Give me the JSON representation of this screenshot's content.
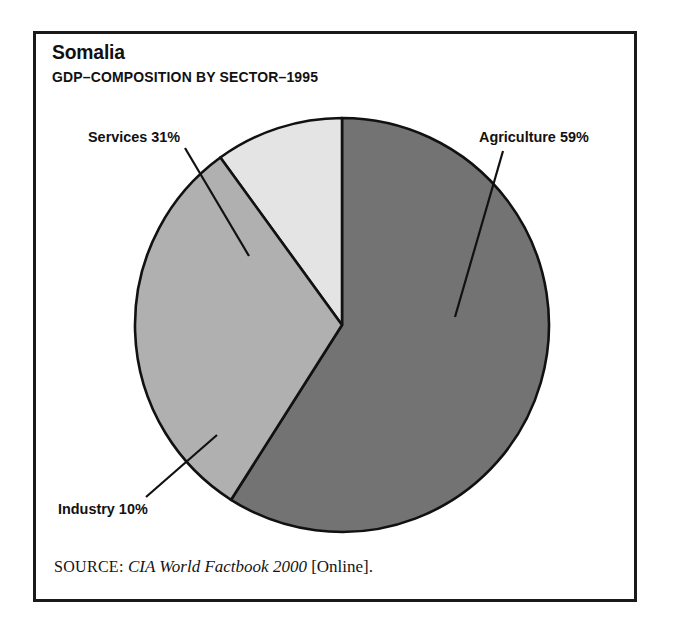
{
  "figure": {
    "title": "Somalia",
    "subtitle": "GDP–COMPOSITION BY SECTOR–1995"
  },
  "source": {
    "label": "SOURCE:",
    "work": "CIA World Factbook 2000",
    "medium": "[Online]."
  },
  "labels": {
    "services": "Services 31%",
    "agriculture": "Agriculture 59%",
    "industry": "Industry 10%"
  },
  "colors": {
    "agriculture": "#737373",
    "services": "#b0b0b0",
    "industry": "#e4e4e4",
    "outline": "#111111",
    "frame": "#1a1a1a",
    "background": "#ffffff"
  },
  "chart_data": {
    "type": "pie",
    "title": "Somalia",
    "subtitle": "GDP–COMPOSITION BY SECTOR–1995",
    "categories": [
      "Agriculture",
      "Services",
      "Industry"
    ],
    "values": [
      59,
      31,
      10
    ],
    "unit": "percent",
    "labels": [
      "Agriculture 59%",
      "Services 31%",
      "Industry 10%"
    ],
    "slice_colors": [
      "#737373",
      "#b0b0b0",
      "#e4e4e4"
    ],
    "start_angle_deg": 0,
    "direction": "clockwise",
    "legend": "none",
    "grid": false,
    "annotations": [
      {
        "text": "Agriculture 59%",
        "slice": "Agriculture",
        "leader": true
      },
      {
        "text": "Services 31%",
        "slice": "Services",
        "leader": true
      },
      {
        "text": "Industry 10%",
        "slice": "Industry",
        "leader": true
      }
    ],
    "source": "SOURCE: CIA World Factbook 2000 [Online]."
  }
}
